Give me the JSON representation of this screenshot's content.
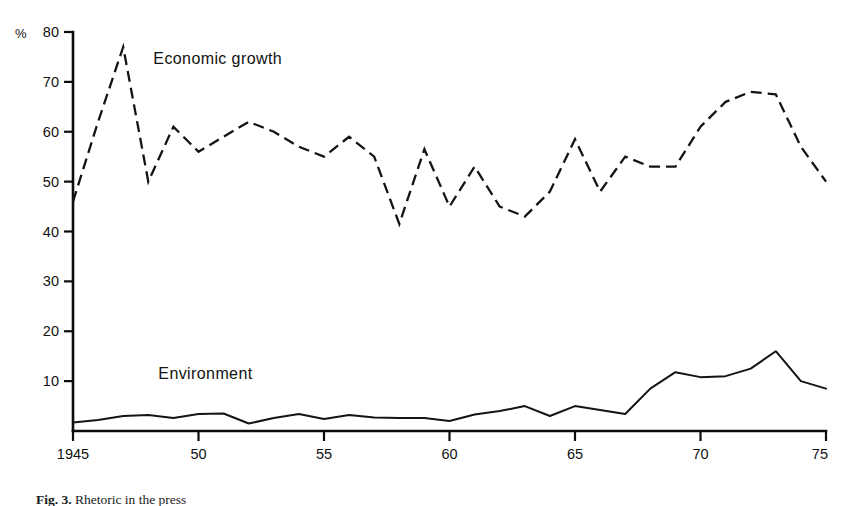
{
  "figure": {
    "caption_label": "Fig. 3.",
    "caption_text": "Rhetoric in the press",
    "unit_symbol": "%"
  },
  "chart_data": {
    "type": "line",
    "title": "",
    "subtitle": "",
    "xlabel": "",
    "ylabel": "%",
    "xlim": [
      1945,
      1975
    ],
    "ylim": [
      0,
      80
    ],
    "grid": false,
    "legend_position": "inline-annotation",
    "x_tick_labels": [
      "1945",
      "50",
      "55",
      "60",
      "65",
      "70",
      "75"
    ],
    "x_tick_values": [
      1945,
      1950,
      1955,
      1960,
      1965,
      1970,
      1975
    ],
    "y_tick_labels": [
      "10",
      "20",
      "30",
      "40",
      "50",
      "60",
      "70",
      "80"
    ],
    "y_tick_values": [
      10,
      20,
      30,
      40,
      50,
      60,
      70,
      80
    ],
    "x": [
      1945,
      1946,
      1947,
      1948,
      1949,
      1950,
      1951,
      1952,
      1953,
      1954,
      1955,
      1956,
      1957,
      1958,
      1959,
      1960,
      1961,
      1962,
      1963,
      1964,
      1965,
      1966,
      1967,
      1968,
      1969,
      1970,
      1971,
      1972,
      1973,
      1974,
      1975
    ],
    "series": [
      {
        "name": "Economic growth",
        "style": "dashed",
        "label_x": 1948.2,
        "label_y": 73.5,
        "values": [
          46,
          62,
          77,
          50,
          61,
          56,
          59,
          62,
          60,
          57,
          55,
          59,
          55,
          41.5,
          56.5,
          45,
          53,
          45,
          43,
          48,
          58.5,
          48,
          55,
          53,
          53,
          61,
          66,
          68,
          67.5,
          57,
          50
        ]
      },
      {
        "name": "Environment",
        "style": "solid",
        "label_x": 1948.4,
        "label_y": 10.5,
        "values": [
          1.7,
          2.2,
          3.0,
          3.2,
          2.6,
          3.4,
          3.5,
          1.5,
          2.6,
          3.4,
          2.4,
          3.2,
          2.7,
          2.6,
          2.6,
          2.0,
          3.3,
          4.0,
          5.0,
          3.0,
          5.0,
          4.2,
          3.4,
          8.5,
          11.8,
          10.8,
          11.0,
          12.5,
          16.0,
          10.0,
          8.5
        ]
      }
    ]
  },
  "geometry": {
    "plot_left_px": 73,
    "plot_right_px": 826,
    "baseline_y_px": 431,
    "top_y_px": 32
  }
}
